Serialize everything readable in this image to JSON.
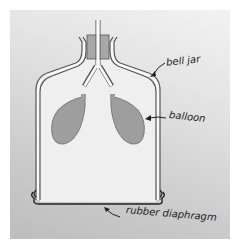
{
  "diagram": {
    "labels": {
      "bell_jar": "bell jar",
      "balloon": "balloon",
      "diaphragm": "rubber diaphragm"
    },
    "colors": {
      "background_top": "#f2f2f2",
      "background_bottom": "#bdbdbd",
      "jar_interior": "#efefef",
      "jar_outline": "#555555",
      "balloon_fill": "#9e9e9e",
      "stopper_fill": "#a8a8a8",
      "diaphragm": "#222222"
    }
  }
}
